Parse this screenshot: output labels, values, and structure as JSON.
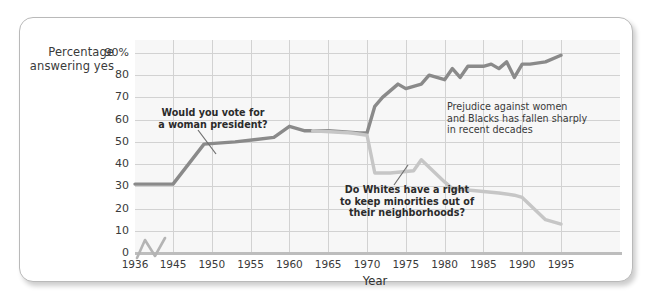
{
  "figure": {
    "y_axis_caption": "Percentage\nanswering yes",
    "x_axis_title": "Year"
  },
  "annotations": {
    "women": "Would you vote for\na woman president?",
    "whites": "Do Whites have a right\nto keep minorities out of\ntheir neighborhoods?",
    "summary": "Prejudice against women\nand Blacks has fallen sharply\nin recent decades"
  },
  "colors": {
    "women_line": "#8a8a8a",
    "whites_line": "#c6c6c6",
    "plot_background": "#f7f7f7",
    "gridline": "#d2d2d2",
    "axis": "#bdbdbd",
    "text": "#2e2e2e"
  },
  "chart_data": {
    "type": "line",
    "title": "",
    "xlabel": "Year",
    "ylabel": "Percentage answering yes",
    "xlim": [
      1936,
      1998
    ],
    "ylim": [
      0,
      95
    ],
    "grid": true,
    "legend": "none (inline annotations)",
    "x_ticks": [
      1936,
      1945,
      1950,
      1955,
      1960,
      1965,
      1970,
      1975,
      1980,
      1985,
      1990,
      1995
    ],
    "y_ticks": [
      0,
      10,
      20,
      30,
      40,
      50,
      60,
      70,
      80,
      90
    ],
    "y_tick_labels": [
      "0",
      "10",
      "20",
      "30",
      "40",
      "50",
      "60",
      "70",
      "80",
      "90%"
    ],
    "x_axis_break_after": 1936,
    "series": [
      {
        "name": "Would you vote for a woman president?",
        "color": "#8a8a8a",
        "points": [
          [
            1936,
            31
          ],
          [
            1945,
            31
          ],
          [
            1949,
            49
          ],
          [
            1953,
            50
          ],
          [
            1958,
            52
          ],
          [
            1960,
            57
          ],
          [
            1962,
            55
          ],
          [
            1965,
            55
          ],
          [
            1969,
            54
          ],
          [
            1970,
            54
          ],
          [
            1971,
            66
          ],
          [
            1972,
            70
          ],
          [
            1974,
            76
          ],
          [
            1975,
            74
          ],
          [
            1977,
            76
          ],
          [
            1978,
            80
          ],
          [
            1980,
            78
          ],
          [
            1981,
            83
          ],
          [
            1982,
            79
          ],
          [
            1983,
            84
          ],
          [
            1985,
            84
          ],
          [
            1986,
            85
          ],
          [
            1987,
            83
          ],
          [
            1988,
            86
          ],
          [
            1989,
            79
          ],
          [
            1990,
            85
          ],
          [
            1991,
            85
          ],
          [
            1993,
            86
          ],
          [
            1995,
            89
          ]
        ]
      },
      {
        "name": "Do Whites have a right to keep minorities out of their neighborhoods?",
        "color": "#c6c6c6",
        "points": [
          [
            1963,
            55
          ],
          [
            1968,
            54
          ],
          [
            1970,
            53
          ],
          [
            1971,
            36
          ],
          [
            1973,
            36
          ],
          [
            1976,
            37
          ],
          [
            1977,
            42
          ],
          [
            1980,
            32
          ],
          [
            1981,
            29
          ],
          [
            1984,
            28
          ],
          [
            1987,
            27
          ],
          [
            1989,
            26
          ],
          [
            1990,
            25
          ],
          [
            1993,
            15
          ],
          [
            1995,
            13
          ]
        ]
      }
    ]
  }
}
